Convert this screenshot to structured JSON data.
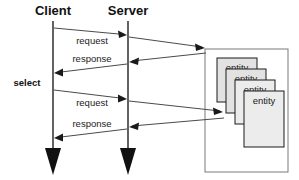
{
  "diagram": {
    "type": "uml-sequence-diagram",
    "canvas": {
      "width": 299,
      "height": 180,
      "background": "#ffffff"
    },
    "colors": {
      "lifeline": "#3b3b3b",
      "message_line": "#4a4a4a",
      "entity_fill": "#e2e2e2",
      "entity_fill_light": "#ececec",
      "entity_border": "#1a1a1a",
      "outer_border": "#7a7a7a",
      "text": "#111111"
    },
    "lifelines": [
      {
        "id": "client",
        "label": "Client",
        "x": 53,
        "label_y": 15,
        "line_top": 21,
        "line_bottom": 152,
        "arrowhead": "solid-triangle-down"
      },
      {
        "id": "server",
        "label": "Server",
        "x": 128,
        "label_y": 15,
        "line_top": 21,
        "line_bottom": 152,
        "arrowhead": "solid-triangle-down"
      }
    ],
    "annotations": [
      {
        "id": "select",
        "label": "select",
        "x": 27,
        "y": 86,
        "bold": true
      }
    ],
    "messages": [
      {
        "id": "msg-request-1",
        "label": "request",
        "from": "client",
        "to": "server",
        "direction": "right",
        "x1": 54,
        "y1": 28,
        "x2": 127,
        "y2": 35,
        "label_x": 92,
        "label_y": 44
      },
      {
        "id": "msg-server-to-entity-1",
        "label": "",
        "from": "server",
        "to": "entity-container",
        "direction": "right",
        "x1": 129,
        "y1": 37,
        "x2": 205,
        "y2": 48,
        "label_x": 0,
        "label_y": 0
      },
      {
        "id": "msg-entity-to-server-1",
        "label": "",
        "from": "entity-container",
        "to": "server",
        "direction": "left",
        "x1": 205,
        "y1": 53,
        "x2": 129,
        "y2": 62,
        "label_x": 0,
        "label_y": 0
      },
      {
        "id": "msg-response-1",
        "label": "response",
        "from": "server",
        "to": "client",
        "direction": "left",
        "x1": 127,
        "y1": 64,
        "x2": 54,
        "y2": 73,
        "label_x": 92,
        "label_y": 62
      },
      {
        "id": "msg-request-2",
        "label": "request",
        "from": "client",
        "to": "server",
        "direction": "right",
        "x1": 54,
        "y1": 90,
        "x2": 127,
        "y2": 99,
        "label_x": 92,
        "label_y": 106
      },
      {
        "id": "msg-server-to-entity-2",
        "label": "",
        "from": "server",
        "to": "entity-3",
        "direction": "right",
        "x1": 129,
        "y1": 101,
        "x2": 223,
        "y2": 112,
        "label_x": 0,
        "label_y": 0
      },
      {
        "id": "msg-entity-to-server-2",
        "label": "",
        "from": "entity-3",
        "to": "server",
        "direction": "left",
        "x1": 223,
        "y1": 118,
        "x2": 129,
        "y2": 127,
        "label_x": 0,
        "label_y": 0
      },
      {
        "id": "msg-response-2",
        "label": "response",
        "from": "server",
        "to": "client",
        "direction": "left",
        "x1": 127,
        "y1": 129,
        "x2": 54,
        "y2": 138,
        "label_x": 92,
        "label_y": 127
      }
    ],
    "container": {
      "id": "entity-container",
      "x": 205,
      "y": 49,
      "width": 83,
      "height": 123
    },
    "entities": [
      {
        "id": "entity-1",
        "label": "entity",
        "x": 217,
        "y": 58,
        "width": 40,
        "height": 44,
        "fill": "#e2e2e2"
      },
      {
        "id": "entity-2",
        "label": "entity",
        "x": 226,
        "y": 69,
        "width": 40,
        "height": 44,
        "fill": "#e2e2e2"
      },
      {
        "id": "entity-3",
        "label": "entity",
        "x": 235,
        "y": 80,
        "width": 40,
        "height": 44,
        "fill": "#ececec"
      },
      {
        "id": "entity-4",
        "label": "entity",
        "x": 244,
        "y": 91,
        "width": 40,
        "height": 56,
        "fill": "#ececec"
      }
    ]
  }
}
